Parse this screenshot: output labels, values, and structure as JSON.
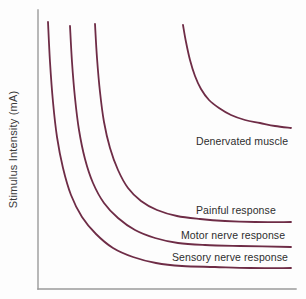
{
  "chart_data": {
    "type": "line",
    "title": "",
    "xlabel": "",
    "ylabel": "Stimulus Intensity (mA)",
    "xlim": [
      0,
      1
    ],
    "ylim": [
      0,
      1
    ],
    "grid": false,
    "legend_position": "inline-right",
    "axis_color": "#9a9a9a",
    "curve_color": "#6e2c46",
    "text_color": "#2e2e2e",
    "series": [
      {
        "name": "Denervated muscle",
        "label": "Denervated muscle",
        "label_x": 196,
        "label_y": 136,
        "asymptote_y": 128,
        "rheobase_level": 0.56,
        "start_x": 183,
        "start_y": 25,
        "end_x": 291,
        "points": [
          [
            183,
            25
          ],
          [
            186,
            42
          ],
          [
            190,
            60
          ],
          [
            195,
            76
          ],
          [
            201,
            89
          ],
          [
            209,
            100
          ],
          [
            219,
            108
          ],
          [
            231,
            115
          ],
          [
            245,
            120
          ],
          [
            260,
            123
          ],
          [
            275,
            126
          ],
          [
            291,
            128
          ]
        ]
      },
      {
        "name": "Painful response",
        "label": "Painful response",
        "label_x": 196,
        "label_y": 205,
        "asymptote_y": 222,
        "rheobase_level": 0.23,
        "start_x": 95,
        "start_y": 24,
        "end_x": 291,
        "points": [
          [
            95,
            24
          ],
          [
            97,
            58
          ],
          [
            100,
            92
          ],
          [
            104,
            122
          ],
          [
            110,
            148
          ],
          [
            118,
            170
          ],
          [
            128,
            188
          ],
          [
            141,
            201
          ],
          [
            157,
            210
          ],
          [
            177,
            216
          ],
          [
            200,
            219
          ],
          [
            225,
            221
          ],
          [
            255,
            222
          ],
          [
            291,
            222
          ]
        ]
      },
      {
        "name": "Motor nerve response",
        "label": "Motor nerve response",
        "label_x": 181,
        "label_y": 230,
        "asymptote_y": 247,
        "rheobase_level": 0.145,
        "start_x": 70,
        "start_y": 26,
        "end_x": 291,
        "points": [
          [
            70,
            26
          ],
          [
            72,
            62
          ],
          [
            75,
            98
          ],
          [
            79,
            130
          ],
          [
            85,
            159
          ],
          [
            93,
            183
          ],
          [
            104,
            203
          ],
          [
            118,
            218
          ],
          [
            135,
            230
          ],
          [
            155,
            238
          ],
          [
            178,
            243
          ],
          [
            205,
            245
          ],
          [
            240,
            246
          ],
          [
            291,
            247
          ]
        ]
      },
      {
        "name": "Sensory nerve response",
        "label": "Sensory nerve response",
        "label_x": 172,
        "label_y": 252,
        "asymptote_y": 268,
        "rheobase_level": 0.072,
        "start_x": 48,
        "start_y": 22,
        "end_x": 291,
        "points": [
          [
            48,
            22
          ],
          [
            50,
            62
          ],
          [
            53,
            102
          ],
          [
            57,
            137
          ],
          [
            63,
            168
          ],
          [
            71,
            195
          ],
          [
            82,
            217
          ],
          [
            96,
            234
          ],
          [
            113,
            248
          ],
          [
            133,
            257
          ],
          [
            156,
            263
          ],
          [
            182,
            266
          ],
          [
            215,
            267
          ],
          [
            250,
            268
          ],
          [
            291,
            268
          ]
        ]
      }
    ],
    "axes": {
      "y_axis_x": 38,
      "y_axis_top": 10,
      "y_axis_bottom": 289,
      "x_axis_y": 289,
      "x_axis_left": 38,
      "x_axis_right": 296
    }
  }
}
